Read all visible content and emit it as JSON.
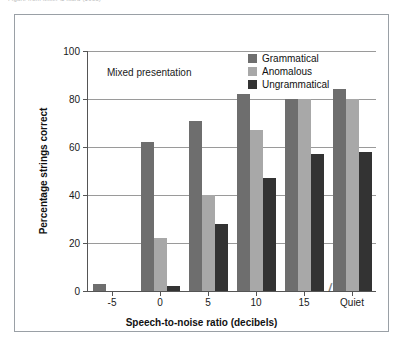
{
  "caption_fragment": "Figure from Miller & Isard (1963)",
  "annotation": "Mixed presentation",
  "legend": {
    "position": "top-right-inside",
    "entries": [
      {
        "label": "Grammatical",
        "color": "#6e6e6e"
      },
      {
        "label": "Anomalous",
        "color": "#a8a8a8"
      },
      {
        "label": "Ungrammatical",
        "color": "#333333"
      }
    ]
  },
  "axis_break_symbol": "⁄⁄",
  "chart_data": {
    "type": "bar",
    "title": "",
    "subtitle": "Mixed presentation",
    "xlabel": "Speech-to-noise ratio (decibels)",
    "ylabel": "Percentage strings correct",
    "categories": [
      "-5",
      "0",
      "5",
      "10",
      "15",
      "Quiet"
    ],
    "series": [
      {
        "name": "Grammatical",
        "color": "#6e6e6e",
        "values": [
          3,
          62,
          71,
          82,
          80,
          84
        ]
      },
      {
        "name": "Anomalous",
        "color": "#a8a8a8",
        "values": [
          0,
          22,
          40,
          67,
          80,
          80
        ]
      },
      {
        "name": "Ungrammatical",
        "color": "#333333",
        "values": [
          0,
          2,
          28,
          47,
          57,
          58
        ]
      }
    ],
    "ylim": [
      0,
      100
    ],
    "yticks": [
      0,
      20,
      40,
      60,
      80,
      100
    ],
    "ytick_labels": [
      "0",
      "20",
      "40",
      "60",
      "80",
      "100"
    ],
    "grid": true,
    "grid_axis": "y",
    "legend_position": "upper right inside",
    "axis_break_before_last_category": true
  }
}
